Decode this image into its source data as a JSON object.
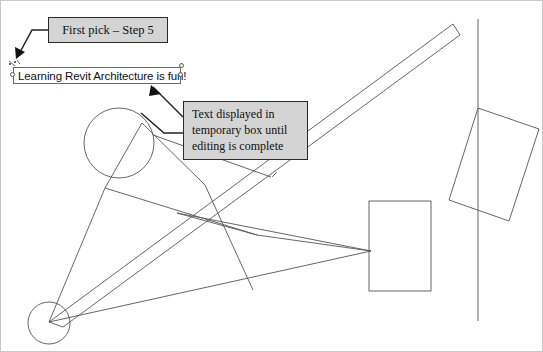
{
  "document": {
    "title": "Revit text tool annotated drawing",
    "background_color": "#ffffff",
    "line_color": "#4a4a4a",
    "callout_fill": "#d4d4d4",
    "callout_border": "#2a2a2a"
  },
  "callouts": [
    {
      "id": "first-pick",
      "text": "First pick – Step 5"
    },
    {
      "id": "temporary-box",
      "line1": "Text displayed in",
      "line2": "temporary box until",
      "line3": "editing is complete"
    }
  ],
  "text_editor": {
    "value": "Learning Revit Architecture is fun!",
    "placeholder": "Type text here"
  },
  "drawing": {
    "circles": [
      {
        "name": "upper-circle",
        "cx": 118,
        "cy": 142,
        "r": 35
      },
      {
        "name": "lower-circle",
        "cx": 48,
        "cy": 322,
        "r": 21
      }
    ],
    "rectangles": [
      {
        "name": "center-rectangle",
        "x": 368,
        "y": 200,
        "w": 62,
        "h": 90
      }
    ],
    "rotated_rectangle": {
      "name": "rotated-rectangle",
      "points": "477,107 538,128 508,220 448,199"
    },
    "vertical_line": {
      "name": "vertical-reference-line",
      "x": 477,
      "y1": 18,
      "y2": 320
    },
    "wall_band": {
      "name": "diagonal-wall-band",
      "points": "452,23 459,33 60,325 48,322"
    }
  }
}
